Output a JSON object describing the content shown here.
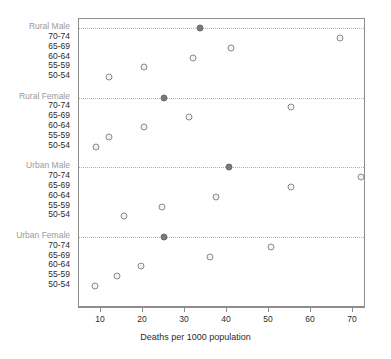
{
  "chart_data": {
    "type": "scatter",
    "title": "",
    "xlabel": "Deaths per 1000 population",
    "ylabel": "",
    "xlim": [
      5,
      75
    ],
    "xticks": [
      10,
      20,
      30,
      40,
      50,
      60,
      70
    ],
    "xticklabels": [
      "10",
      "20",
      "30",
      "40",
      "50",
      "60",
      "70"
    ],
    "grid": "horizontal-dotted-at-group-headers",
    "legend": "none",
    "groups": [
      {
        "name": "Rural Male",
        "categories": [
          "70-74",
          "65-69",
          "60-64",
          "55-59",
          "50-54"
        ],
        "values": [
          66.9,
          41.0,
          32.0,
          20.2,
          11.9
        ]
      },
      {
        "name": "Rural Female",
        "categories": [
          "70-74",
          "65-69",
          "60-64",
          "55-59",
          "50-54"
        ],
        "values": [
          55.2,
          31.0,
          20.2,
          11.9,
          8.8
        ]
      },
      {
        "name": "Urban Male",
        "categories": [
          "70-74",
          "65-69",
          "60-64",
          "55-59",
          "50-54"
        ],
        "values": [
          71.9,
          55.2,
          37.4,
          24.5,
          15.5
        ]
      },
      {
        "name": "Urban Female",
        "categories": [
          "70-74",
          "65-69",
          "60-64",
          "55-59",
          "50-54"
        ],
        "values": [
          50.5,
          36.0,
          19.5,
          13.8,
          8.5
        ]
      }
    ],
    "group_header_markers": [
      {
        "group": "Rural Male",
        "value": 33.5
      },
      {
        "group": "Rural Female",
        "value": 25.0
      },
      {
        "group": "Urban Male",
        "value": 40.5
      },
      {
        "group": "Urban Female",
        "value": 25.0
      }
    ],
    "colors": {
      "point_fill": "#f3f3f3",
      "point_edge": "#8a8a8a",
      "point_filled": "#7a7a7a",
      "grid": "#c3a9a9",
      "axis": "#8d8d8d",
      "text": "#2b2b2b",
      "group_label_text": "#9a9a9a"
    }
  }
}
